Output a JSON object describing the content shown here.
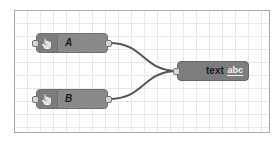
{
  "canvas": {
    "grid": true
  },
  "nodes": [
    {
      "id": "A",
      "label": "A",
      "type": "inject",
      "icon": "hand-pointer-icon"
    },
    {
      "id": "B",
      "label": "B",
      "type": "inject",
      "icon": "hand-pointer-icon"
    },
    {
      "id": "text",
      "label": "text",
      "type": "text",
      "badge": "abc"
    }
  ],
  "wires": [
    {
      "from": "A",
      "to": "text"
    },
    {
      "from": "B",
      "to": "text"
    }
  ],
  "colors": {
    "node_fill": "#8a8a8a",
    "node_border": "#6f6f6f",
    "wire": "#555555",
    "grid": "#e8e8e8"
  }
}
